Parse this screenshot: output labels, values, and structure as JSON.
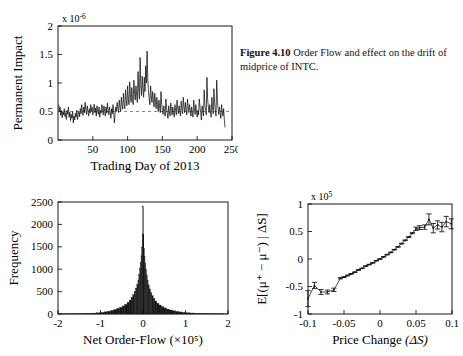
{
  "caption": {
    "figure_number": "Figure 4.10",
    "text": "Order Flow and effect on the drift of midprice of INTC."
  },
  "chart_data": [
    {
      "id": "permanent-impact",
      "type": "line",
      "title": "",
      "xlabel": "Trading Day of 2013",
      "ylabel": "Permanent Impact",
      "y_exponent": "x 10",
      "y_exponent_sup": "-6",
      "xlim": [
        0,
        250
      ],
      "ylim": [
        0,
        2
      ],
      "xticks": [
        50,
        100,
        150,
        200,
        250
      ],
      "xticklabels": [
        "50",
        "100",
        "150",
        "200",
        "250"
      ],
      "yticks": [
        0,
        0.5,
        1,
        1.5,
        2
      ],
      "yticklabels": [
        "0",
        "0.5",
        "1",
        "1.5",
        "2"
      ],
      "grid": false,
      "reference_line_y": 0.5,
      "x": [
        1,
        2,
        3,
        4,
        5,
        6,
        7,
        8,
        9,
        10,
        11,
        12,
        13,
        14,
        15,
        16,
        17,
        18,
        19,
        20,
        21,
        22,
        23,
        24,
        25,
        26,
        27,
        28,
        29,
        30,
        31,
        32,
        33,
        34,
        35,
        36,
        37,
        38,
        39,
        40,
        41,
        42,
        43,
        44,
        45,
        46,
        47,
        48,
        49,
        50,
        51,
        52,
        53,
        54,
        55,
        56,
        57,
        58,
        59,
        60,
        61,
        62,
        63,
        64,
        65,
        66,
        67,
        68,
        69,
        70,
        71,
        72,
        73,
        74,
        75,
        76,
        77,
        78,
        79,
        80,
        81,
        82,
        83,
        84,
        85,
        86,
        87,
        88,
        89,
        90,
        91,
        92,
        93,
        94,
        95,
        96,
        97,
        98,
        99,
        100,
        101,
        102,
        103,
        104,
        105,
        106,
        107,
        108,
        109,
        110,
        111,
        112,
        113,
        114,
        115,
        116,
        117,
        118,
        119,
        120,
        121,
        122,
        123,
        124,
        125,
        126,
        127,
        128,
        129,
        130,
        131,
        132,
        133,
        134,
        135,
        136,
        137,
        138,
        139,
        140,
        141,
        142,
        143,
        144,
        145,
        146,
        147,
        148,
        149,
        150,
        151,
        152,
        153,
        154,
        155,
        156,
        157,
        158,
        159,
        160,
        161,
        162,
        163,
        164,
        165,
        166,
        167,
        168,
        169,
        170,
        171,
        172,
        173,
        174,
        175,
        176,
        177,
        178,
        179,
        180,
        181,
        182,
        183,
        184,
        185,
        186,
        187,
        188,
        189,
        190,
        191,
        192,
        193,
        194,
        195,
        196,
        197,
        198,
        199,
        200,
        201,
        202,
        203,
        204,
        205,
        206,
        207,
        208,
        209,
        210,
        211,
        212,
        213,
        214,
        215,
        216,
        217,
        218,
        219,
        220,
        221,
        222,
        223,
        224,
        225,
        226,
        227,
        228,
        229,
        230,
        231,
        232,
        233,
        234,
        235,
        236,
        237,
        238,
        239,
        240,
        241,
        242,
        243,
        244,
        245,
        246,
        247,
        248,
        249,
        250
      ],
      "y": [
        0.62,
        0.5,
        0.58,
        0.43,
        0.52,
        0.39,
        0.5,
        0.44,
        0.55,
        0.41,
        0.48,
        0.36,
        0.52,
        0.45,
        0.58,
        0.4,
        0.49,
        0.34,
        0.45,
        0.38,
        0.5,
        0.3,
        0.42,
        0.35,
        0.47,
        0.4,
        0.52,
        0.36,
        0.44,
        0.5,
        0.41,
        0.55,
        0.46,
        0.62,
        0.5,
        0.43,
        0.58,
        0.48,
        0.66,
        0.52,
        0.45,
        0.6,
        0.5,
        0.42,
        0.55,
        0.47,
        0.62,
        0.5,
        0.58,
        0.44,
        0.52,
        0.63,
        0.48,
        0.56,
        0.42,
        0.6,
        0.5,
        0.45,
        0.58,
        0.4,
        0.52,
        0.47,
        0.62,
        0.55,
        0.44,
        0.6,
        0.5,
        0.42,
        0.58,
        0.47,
        0.65,
        0.52,
        0.44,
        0.58,
        0.49,
        0.38,
        0.55,
        0.46,
        0.62,
        0.5,
        0.3,
        0.45,
        0.58,
        0.5,
        0.66,
        0.55,
        0.48,
        0.7,
        0.58,
        0.5,
        0.75,
        0.62,
        0.54,
        0.82,
        0.64,
        0.55,
        0.88,
        0.7,
        0.6,
        0.95,
        0.72,
        0.62,
        1.02,
        0.8,
        0.66,
        0.92,
        0.74,
        0.62,
        1.05,
        0.82,
        0.7,
        0.95,
        0.78,
        0.66,
        1.2,
        0.88,
        0.72,
        1.45,
        0.95,
        0.78,
        1.12,
        0.9,
        0.75,
        1.1,
        0.85,
        1.3,
        1.0,
        1.56,
        1.08,
        0.85,
        0.72,
        0.62,
        0.95,
        0.78,
        0.66,
        0.85,
        0.7,
        0.58,
        0.82,
        0.68,
        0.55,
        0.75,
        0.62,
        0.5,
        0.7,
        0.58,
        0.48,
        0.85,
        0.62,
        0.52,
        0.45,
        0.6,
        0.5,
        0.42,
        0.72,
        0.55,
        0.46,
        0.38,
        0.6,
        0.5,
        0.42,
        0.65,
        0.52,
        0.44,
        0.58,
        0.48,
        0.4,
        0.62,
        0.52,
        0.44,
        0.7,
        0.56,
        0.46,
        0.6,
        0.5,
        0.42,
        0.68,
        0.55,
        0.46,
        0.75,
        0.58,
        0.48,
        0.66,
        0.54,
        0.44,
        0.72,
        0.58,
        0.48,
        0.62,
        0.52,
        0.42,
        0.58,
        0.48,
        0.4,
        0.7,
        0.55,
        0.45,
        0.62,
        0.5,
        0.4,
        0.52,
        0.44,
        0.72,
        0.58,
        0.48,
        0.35,
        0.6,
        0.5,
        0.42,
        0.88,
        0.62,
        0.52,
        0.44,
        1.1,
        0.72,
        0.58,
        0.48,
        0.62,
        0.5,
        0.4,
        0.75,
        0.58,
        0.46,
        0.9,
        0.66,
        0.52,
        0.42,
        1.05,
        0.7,
        0.55,
        0.45,
        0.58,
        0.48,
        0.38,
        0.62,
        0.5,
        0.42,
        0.55,
        0.35,
        0.22
      ]
    },
    {
      "id": "orderflow-hist",
      "type": "bar",
      "title": "",
      "xlabel": "Net Order-Flow",
      "xlabel_exponent": "(×10⁵)",
      "ylabel": "Frequency",
      "xlim": [
        -2,
        2
      ],
      "ylim": [
        0,
        2500
      ],
      "xticks": [
        -2,
        -1,
        0,
        1,
        2
      ],
      "xticklabels": [
        "-2",
        "-1",
        "0",
        "1",
        "2"
      ],
      "yticks": [
        0,
        500,
        1000,
        1500,
        2000,
        2500
      ],
      "yticklabels": [
        "0",
        "500",
        "1000",
        "1500",
        "2000",
        "2500"
      ],
      "grid": false,
      "bin_centers": [
        -1.95,
        -1.85,
        -1.75,
        -1.65,
        -1.55,
        -1.45,
        -1.35,
        -1.25,
        -1.15,
        -1.05,
        -0.95,
        -0.88,
        -0.8,
        -0.72,
        -0.65,
        -0.58,
        -0.52,
        -0.46,
        -0.4,
        -0.35,
        -0.3,
        -0.26,
        -0.22,
        -0.19,
        -0.16,
        -0.13,
        -0.11,
        -0.09,
        -0.07,
        -0.055,
        -0.04,
        -0.025,
        -0.012,
        0.0,
        0.012,
        0.025,
        0.04,
        0.055,
        0.07,
        0.09,
        0.11,
        0.13,
        0.16,
        0.19,
        0.22,
        0.26,
        0.3,
        0.35,
        0.4,
        0.46,
        0.52,
        0.58,
        0.65,
        0.72,
        0.8,
        0.88,
        0.95,
        1.05,
        1.15,
        1.25,
        1.35,
        1.45,
        1.55,
        1.65,
        1.75,
        1.85,
        1.95
      ],
      "counts": [
        3,
        4,
        5,
        6,
        8,
        10,
        13,
        16,
        20,
        26,
        36,
        48,
        62,
        80,
        100,
        125,
        150,
        180,
        215,
        260,
        310,
        370,
        430,
        500,
        580,
        660,
        760,
        880,
        1010,
        1150,
        1300,
        1480,
        1790,
        2410,
        1780,
        1470,
        1290,
        1140,
        1000,
        870,
        750,
        650,
        560,
        480,
        410,
        345,
        290,
        240,
        200,
        165,
        135,
        110,
        90,
        72,
        58,
        46,
        36,
        28,
        22,
        17,
        13,
        10,
        8,
        6,
        5,
        4,
        3
      ]
    },
    {
      "id": "price-impact",
      "type": "line",
      "title": "",
      "xlabel": "Price Change",
      "xlabel_symbol": "(ΔS)",
      "ylabel": "E[(μ⁺ − μ⁻) | ΔS]",
      "y_exponent": "x 10",
      "y_exponent_sup": "5",
      "xlim": [
        -0.1,
        0.1
      ],
      "ylim": [
        -1,
        1
      ],
      "xticks": [
        -0.1,
        -0.05,
        0,
        0.05,
        0.1
      ],
      "xticklabels": [
        "-0.1",
        "-0.05",
        "0",
        "0.05",
        "0.1"
      ],
      "yticks": [
        -1,
        -0.5,
        0,
        0.5,
        1
      ],
      "yticklabels": [
        "-1",
        "-0.5",
        "0",
        "0.5",
        "1"
      ],
      "grid": false,
      "has_errorbars": true,
      "x": [
        -0.1,
        -0.091,
        -0.082,
        -0.073,
        -0.064,
        -0.055,
        -0.05,
        -0.045,
        -0.04,
        -0.035,
        -0.03,
        -0.025,
        -0.02,
        -0.015,
        -0.01,
        -0.005,
        0.0,
        0.005,
        0.01,
        0.015,
        0.02,
        0.025,
        0.03,
        0.035,
        0.04,
        0.045,
        0.05,
        0.055,
        0.062,
        0.068,
        0.074,
        0.08,
        0.086,
        0.092,
        0.099
      ],
      "y": [
        -0.72,
        -0.48,
        -0.6,
        -0.6,
        -0.56,
        -0.35,
        -0.33,
        -0.3,
        -0.27,
        -0.24,
        -0.2,
        -0.17,
        -0.13,
        -0.1,
        -0.07,
        -0.03,
        0.0,
        0.04,
        0.08,
        0.12,
        0.17,
        0.22,
        0.28,
        0.34,
        0.4,
        0.47,
        0.55,
        0.57,
        0.58,
        0.72,
        0.56,
        0.62,
        0.58,
        0.68,
        0.64
      ],
      "yerr": [
        0.145,
        0.055,
        0.045,
        0.035,
        0.03,
        0.012,
        0.008,
        0.007,
        0.006,
        0.005,
        0.005,
        0.004,
        0.004,
        0.004,
        0.004,
        0.004,
        0.004,
        0.004,
        0.004,
        0.004,
        0.004,
        0.005,
        0.005,
        0.006,
        0.007,
        0.01,
        0.03,
        0.035,
        0.04,
        0.1,
        0.085,
        0.075,
        0.085,
        0.095,
        0.09
      ]
    }
  ]
}
